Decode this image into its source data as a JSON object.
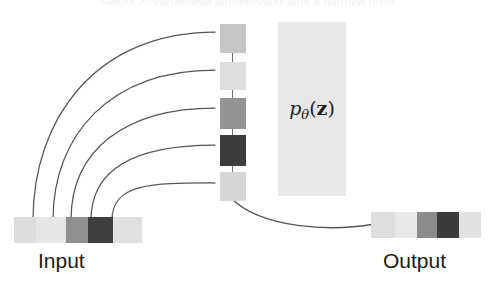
{
  "figure": {
    "ghost_caption_top": "Figure 2: Variational autoencoder with a learned prior",
    "background": "#ffffff",
    "stroke_color": "#555555"
  },
  "input": {
    "label": "Input",
    "name": "input-data-bar",
    "segments": [
      {
        "color": "#dcdcdc",
        "width": 22
      },
      {
        "color": "#e6e6e6",
        "width": 30
      },
      {
        "color": "#8f8f8f",
        "width": 22
      },
      {
        "color": "#3f3f3f",
        "width": 25
      },
      {
        "color": "#e0e0e0",
        "width": 29
      }
    ]
  },
  "output": {
    "label": "Output",
    "name": "output-data-bar",
    "segments": [
      {
        "color": "#dedede",
        "width": 24
      },
      {
        "color": "#e8e8e8",
        "width": 22
      },
      {
        "color": "#8c8c8c",
        "width": 20
      },
      {
        "color": "#3b3b3b",
        "width": 22
      },
      {
        "color": "#e2e2e2",
        "width": 22
      }
    ]
  },
  "latent": {
    "name": "latent-variable-column",
    "units": [
      {
        "color": "#c6c6c6",
        "top": 1,
        "height": 29
      },
      {
        "color": "#dedede",
        "top": 39,
        "height": 28
      },
      {
        "color": "#949494",
        "top": 75,
        "height": 31
      },
      {
        "color": "#3c3c3c",
        "top": 112,
        "height": 31
      },
      {
        "color": "#d6d6d6",
        "top": 149,
        "height": 29
      }
    ]
  },
  "prior": {
    "name": "prior-distribution-box",
    "box_color": "#e7e7e7",
    "label_p": "p",
    "label_theta": "θ",
    "label_open": "(",
    "label_z": "z",
    "label_close": ")"
  },
  "encoder_arcs": {
    "name": "encoder-connection-arcs",
    "count": 5,
    "paths": [
      "M 33 220 C 33 120 95 32 215 32",
      "M 53 220 C 53 135 110 70 215 70",
      "M 71 220 C 71 150 125 108 215 108",
      "M 91 220 C 91 165 140 145 215 145",
      "M 112 220 C 112 182 155 183 215 183"
    ]
  },
  "decoder_arc": {
    "name": "decoder-connection-arc",
    "path": "M 232 199 C 262 228 330 232 374 224"
  }
}
